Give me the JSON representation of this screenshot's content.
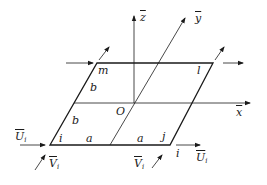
{
  "diagram": {
    "type": "plate-element-coordinate-system",
    "colors": {
      "line": "#1a1a1a",
      "background": "#ffffff"
    },
    "axes": {
      "x": {
        "label": "x",
        "overline": true
      },
      "y": {
        "label": "y",
        "overline": true
      },
      "z": {
        "label": "z",
        "overline": true
      },
      "origin": {
        "label": "O"
      }
    },
    "nodes": {
      "i": {
        "label": "i"
      },
      "j": {
        "label": "j"
      },
      "l": {
        "label": "l"
      },
      "m": {
        "label": "m"
      }
    },
    "dimensions": {
      "a_left": "a",
      "a_right": "a",
      "b_upper": "b",
      "b_lower": "b"
    },
    "forces": {
      "U_left": {
        "symbol": "U",
        "subscript": "i"
      },
      "V_left": {
        "symbol": "V",
        "subscript": "i"
      },
      "U_right": {
        "symbol": "U",
        "subscript": "i"
      },
      "V_bottom": {
        "symbol": "V",
        "subscript": "i"
      },
      "node_i_right_label": "i"
    }
  }
}
